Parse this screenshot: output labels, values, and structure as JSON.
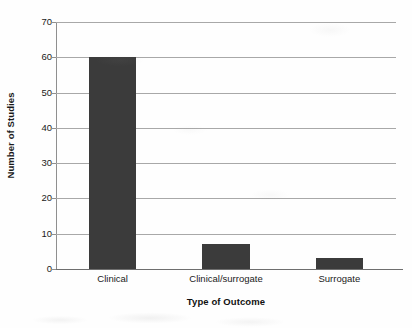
{
  "chart_data": {
    "type": "bar",
    "title": "",
    "categories": [
      "Clinical",
      "Clinical/surrogate",
      "Surrogate"
    ],
    "values": [
      60,
      7,
      3
    ],
    "xlabel": "Type of Outcome",
    "ylabel": "Number of Studies",
    "ylim": [
      0,
      70
    ],
    "yticks": [
      0,
      10,
      20,
      30,
      40,
      50,
      60,
      70
    ],
    "ytick_labels": [
      "0",
      "10",
      "20",
      "30",
      "40",
      "50",
      "60",
      "70"
    ],
    "grid": true,
    "grid_axis": "y",
    "legend": false,
    "legend_position": "none",
    "bar_color": "#3b3b3b",
    "gridline_color": "#a8a8a8",
    "axis_color": "#6e6e6e",
    "text_color": "#1a1a1a",
    "background_color": "#fefefe"
  }
}
